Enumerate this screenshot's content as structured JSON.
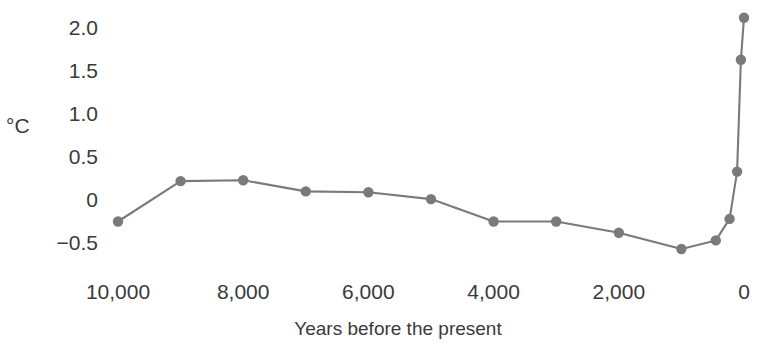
{
  "chart_data": {
    "type": "line",
    "title": "",
    "subtitle": "",
    "xlabel": "Years before the present",
    "ylabel": "°C",
    "x_tick_labels": [
      "10,000",
      "8,000",
      "6,000",
      "4,000",
      "2,000",
      "0"
    ],
    "x_ticks": [
      10000,
      8000,
      6000,
      4000,
      2000,
      0
    ],
    "y_tick_labels": [
      "2.0",
      "1.5",
      "1.0",
      "0.5",
      "0",
      "−0.5"
    ],
    "y_ticks": [
      2.0,
      1.5,
      1.0,
      0.5,
      0,
      -0.5
    ],
    "xlim": [
      10600,
      -300
    ],
    "ylim": [
      -0.75,
      2.35
    ],
    "x_axis_reversed": true,
    "grid": false,
    "legend": false,
    "legend_position": "none",
    "marker": "circle",
    "marker_color": "#7a7a7a",
    "line_color": "#7a7a7a",
    "x": [
      10000,
      9000,
      8000,
      7000,
      6000,
      5000,
      4000,
      3000,
      2000,
      1000,
      450,
      230,
      110,
      50,
      0
    ],
    "y": [
      -0.25,
      0.22,
      0.23,
      0.1,
      0.09,
      0.01,
      -0.25,
      -0.25,
      -0.38,
      -0.57,
      -0.47,
      -0.22,
      0.33,
      1.63,
      2.12
    ],
    "series": [
      {
        "name": "Global temperature anomaly",
        "x": [
          10000,
          9000,
          8000,
          7000,
          6000,
          5000,
          4000,
          3000,
          2000,
          1000,
          450,
          230,
          110,
          50,
          0
        ],
        "values": [
          -0.25,
          0.22,
          0.23,
          0.1,
          0.09,
          0.01,
          -0.25,
          -0.25,
          -0.38,
          -0.57,
          -0.47,
          -0.22,
          0.33,
          1.63,
          2.12
        ]
      }
    ],
    "annotations": []
  },
  "colors": {
    "line": "#7a7a7a",
    "marker": "#7a7a7a",
    "text": "#3a3a3a",
    "background": "#ffffff"
  }
}
